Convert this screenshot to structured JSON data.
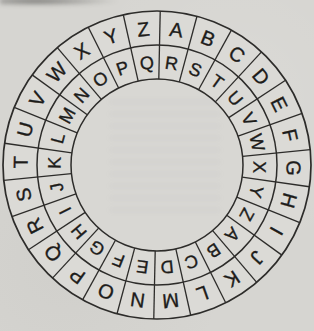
{
  "page": {
    "paper_color": "#d6d5d1",
    "wheel_fill": "#dbdad6",
    "hole_fill": "#d8d7d3",
    "line_color": "#2d2c2a",
    "letter_color": "#1d1c1a"
  },
  "cipher_wheel": {
    "outer_ring_letters": [
      "A",
      "B",
      "C",
      "D",
      "E",
      "F",
      "G",
      "H",
      "I",
      "J",
      "K",
      "L",
      "M",
      "N",
      "O",
      "P",
      "Q",
      "R",
      "S",
      "T",
      "U",
      "V",
      "W",
      "X",
      "Y",
      "Z"
    ],
    "inner_ring_letters": [
      "R",
      "S",
      "T",
      "U",
      "V",
      "W",
      "X",
      "Y",
      "Z",
      "A",
      "B",
      "C",
      "D",
      "E",
      "F",
      "G",
      "H",
      "I",
      "J",
      "K",
      "L",
      "M",
      "N",
      "O",
      "P",
      "Q"
    ]
  }
}
